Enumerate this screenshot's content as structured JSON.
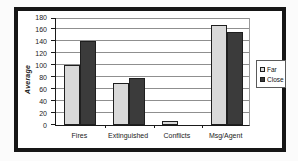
{
  "figure": {
    "background": "#fbfbfb",
    "frame_color": "#161616"
  },
  "chart_data": {
    "type": "bar",
    "title": "",
    "xlabel": "",
    "ylabel": "Average",
    "categories": [
      "Fires",
      "Extinguished",
      "Conflicts",
      "Msg/Agent"
    ],
    "series": [
      {
        "name": "Far",
        "color": "#d9d9d9",
        "values": [
          100,
          70,
          7,
          166
        ]
      },
      {
        "name": "Close",
        "color": "#3b3b3b",
        "values": [
          140,
          78,
          0,
          155
        ]
      }
    ],
    "ylim": [
      0,
      180
    ],
    "yticks": [
      0,
      20,
      40,
      60,
      80,
      100,
      120,
      140,
      160,
      180
    ],
    "grid": true,
    "legend_position": "right",
    "legend_labels": [
      "Far",
      "Close"
    ]
  }
}
